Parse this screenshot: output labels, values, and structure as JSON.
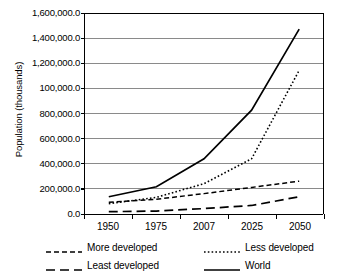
{
  "chart_data": {
    "type": "line",
    "title": "",
    "xlabel": "",
    "ylabel": "Population (thousands)",
    "categories": [
      "1950",
      "1975",
      "2007",
      "2025",
      "2050"
    ],
    "ylim": [
      0,
      1600000
    ],
    "ytick_values": [
      0,
      200000,
      400000,
      600000,
      800000,
      1000000,
      1200000,
      1400000,
      1600000
    ],
    "ytick_labels": [
      "0.0",
      "200,000.0",
      "400,000.0",
      "600,000.0",
      "800,000.0",
      "100,000.0",
      "1,200,000.0",
      "1,400,000.0",
      "1,600,000.0"
    ],
    "grid": "horizontal",
    "legend_position": "bottom",
    "series": [
      {
        "name": "More developed",
        "dash": "dashed",
        "color": "#000000",
        "values": [
          80000,
          105000,
          150000,
          200000,
          250000
        ]
      },
      {
        "name": "Less developed",
        "dash": "dotted",
        "color": "#000000",
        "values": [
          70000,
          120000,
          230000,
          430000,
          1140000
        ]
      },
      {
        "name": "Least developed",
        "dash": "longdash",
        "color": "#000000",
        "values": [
          5000,
          10000,
          30000,
          55000,
          125000
        ]
      },
      {
        "name": "World",
        "dash": "solid",
        "color": "#000000",
        "values": [
          125000,
          205000,
          430000,
          820000,
          1470000
        ]
      }
    ]
  },
  "legend": {
    "items": [
      {
        "label": "More developed",
        "dash": "dashed"
      },
      {
        "label": "Less developed",
        "dash": "dotted"
      },
      {
        "label": "Least developed",
        "dash": "longdash"
      },
      {
        "label": "World",
        "dash": "solid"
      }
    ]
  }
}
